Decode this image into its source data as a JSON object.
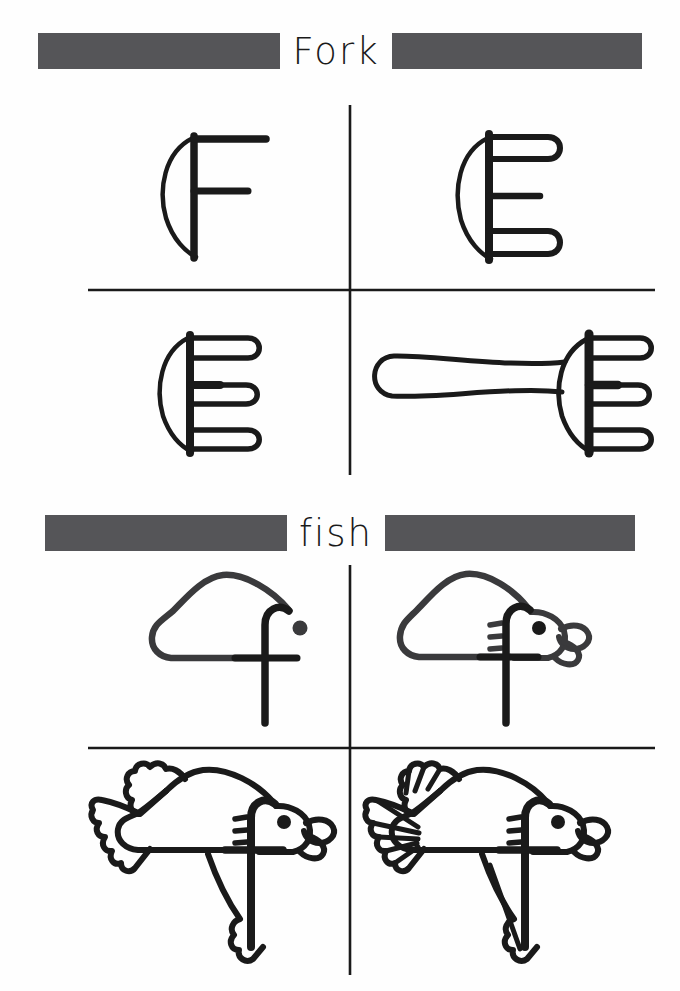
{
  "page": {
    "kind": "drawing-tutorial-worksheet",
    "background_color": "#fefefe",
    "ink_color": "#1a1a1a",
    "bar_color": "#555558"
  },
  "sections": [
    {
      "id": "fork",
      "title": "Fork",
      "title_case": "uppercase-initial",
      "divider": {
        "vertical_x": 350,
        "horizontal_y": 290
      },
      "steps": [
        {
          "index": 1,
          "name": "step-1-letter-F",
          "caption": "Letter F with left arc"
        },
        {
          "index": 2,
          "name": "step-2-two-tines",
          "caption": "Top and bottom tines looped"
        },
        {
          "index": 3,
          "name": "step-3-three-tines",
          "caption": "Middle tine looped"
        },
        {
          "index": 4,
          "name": "step-4-complete-fork",
          "caption": "Handle added - finished fork"
        }
      ]
    },
    {
      "id": "fish",
      "title": "fish",
      "title_case": "lowercase",
      "divider": {
        "vertical_x": 350,
        "horizontal_y": 748
      },
      "steps": [
        {
          "index": 1,
          "name": "step-1-letter-f-body",
          "caption": "Letter f with eye dot and body outline"
        },
        {
          "index": 2,
          "name": "step-2-head-and-mouth",
          "caption": "Head, gills and lips added"
        },
        {
          "index": 3,
          "name": "step-3-fins-and-tail",
          "caption": "Tail, dorsal fin and pectoral fin added"
        },
        {
          "index": 4,
          "name": "step-4-complete-fish",
          "caption": "Fin detail lines - finished fish"
        }
      ]
    }
  ]
}
